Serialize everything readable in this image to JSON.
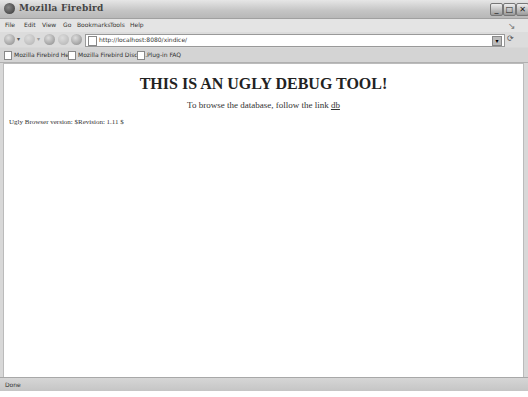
{
  "window": {
    "title": "Mozilla Firebird",
    "controls": {
      "minimize": "_",
      "maximize": "□",
      "close": "✕"
    }
  },
  "menubar": {
    "items": [
      {
        "label": "File"
      },
      {
        "label": "Edit"
      },
      {
        "label": "View"
      },
      {
        "label": "Go"
      },
      {
        "label": "Bookmarks"
      },
      {
        "label": "Tools"
      },
      {
        "label": "Help"
      }
    ]
  },
  "navbar": {
    "url": "http://localhost:8080/xindice/",
    "icons": [
      "back-icon",
      "forward-icon",
      "reload-icon",
      "stop-icon",
      "home-icon"
    ]
  },
  "bookmarks": {
    "items": [
      {
        "label": "Mozilla Firebird Help"
      },
      {
        "label": "Mozilla Firebird Discu..."
      },
      {
        "label": "Plug-in FAQ"
      }
    ]
  },
  "page": {
    "heading": "THIS IS AN UGLY DEBUG TOOL!",
    "browse_text": "To browse the database, follow the link ",
    "browse_link": "db",
    "version": "Ugly Browser version: $Revision: 1.11 $"
  },
  "statusbar": {
    "status": "Done"
  },
  "colors": {
    "chrome": "#d8d8d8",
    "content_bg": "#ffffff",
    "text": "#333333"
  }
}
